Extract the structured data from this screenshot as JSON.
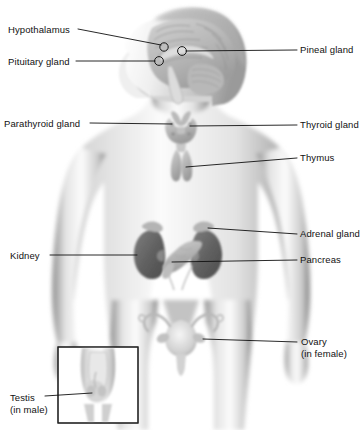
{
  "figure": {
    "type": "anatomical-diagram",
    "view": "anterior body silhouette with left-facing head profile",
    "colors": {
      "background": "#ffffff",
      "body_light": "#f2f2f2",
      "body_mid": "#c9c9c9",
      "body_shadow": "#8d8d8d",
      "organ_gray": "#b4b4b4",
      "kidney_dark": "#6d6d6d",
      "leader_line": "#111111",
      "text": "#111111",
      "inset_border": "#222222"
    }
  },
  "labels": {
    "hypothalamus": {
      "text": "Hypothalamus",
      "side": "left",
      "x": 8,
      "y": 24
    },
    "pituitary": {
      "text": "Pituitary gland",
      "side": "left",
      "x": 8,
      "y": 56
    },
    "pineal": {
      "text": "Pineal gland",
      "side": "right",
      "x": 300,
      "y": 44
    },
    "parathyroid": {
      "text": "Parathyroid gland",
      "side": "left",
      "x": 4,
      "y": 118
    },
    "thyroid": {
      "text": "Thyroid gland",
      "side": "right",
      "x": 300,
      "y": 119
    },
    "thymus": {
      "text": "Thymus",
      "side": "right",
      "x": 300,
      "y": 152
    },
    "adrenal": {
      "text": "Adrenal gland",
      "side": "right",
      "x": 300,
      "y": 228
    },
    "kidney": {
      "text": "Kidney",
      "side": "left",
      "x": 10,
      "y": 250
    },
    "pancreas": {
      "text": "Pancreas",
      "side": "right",
      "x": 300,
      "y": 254
    },
    "ovary_line1": {
      "text": "Ovary",
      "side": "right",
      "x": 301,
      "y": 336
    },
    "ovary_line2": {
      "text": "(in female)",
      "side": "right",
      "x": 301,
      "y": 348
    },
    "testis_line1": {
      "text": "Testis",
      "side": "left",
      "x": 10,
      "y": 392
    },
    "testis_line2": {
      "text": "(in male)",
      "side": "left",
      "x": 10,
      "y": 404
    }
  },
  "glands": [
    {
      "name": "Hypothalamus",
      "marker": "circle",
      "cx": 164,
      "cy": 47
    },
    {
      "name": "Pituitary gland",
      "marker": "circle",
      "cx": 159,
      "cy": 61
    },
    {
      "name": "Pineal gland",
      "marker": "circle",
      "cx": 182,
      "cy": 51
    },
    {
      "name": "Thyroid gland",
      "marker": "butterfly",
      "cx": 181,
      "cy": 128
    },
    {
      "name": "Parathyroid gland",
      "marker": "butterfly-posterior",
      "cx": 178,
      "cy": 126
    },
    {
      "name": "Thymus",
      "marker": "two-lobes",
      "cx": 181,
      "cy": 160
    },
    {
      "name": "Adrenal gland",
      "marker": "cap",
      "cx": 196,
      "cy": 236
    },
    {
      "name": "Kidney",
      "marker": "bean",
      "cx": 152,
      "cy": 250
    },
    {
      "name": "Pancreas",
      "marker": "elongated",
      "cx": 178,
      "cy": 254
    },
    {
      "name": "Ovary",
      "marker": "oval",
      "cx": 199,
      "cy": 341
    },
    {
      "name": "Testis",
      "marker": "oval",
      "cx": 96,
      "cy": 393
    }
  ],
  "inset": {
    "name": "male-pelvis-inset",
    "x": 58,
    "y": 347,
    "width": 80,
    "height": 76,
    "caption": "Testis (in male)"
  }
}
